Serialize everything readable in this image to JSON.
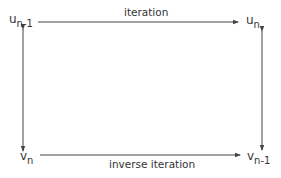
{
  "nodes": {
    "top_left": {
      "base": "u",
      "sub": "n-1"
    },
    "top_right": {
      "base": "u",
      "sub": "n"
    },
    "bottom_left": {
      "base": "v",
      "sub": "n"
    },
    "bottom_right": {
      "base": "v",
      "sub": "n-1"
    }
  },
  "edges": {
    "top": {
      "label": "iteration",
      "from": "u_{n-1}",
      "to": "u_n",
      "direction": "right"
    },
    "bottom": {
      "label": "inverse iteration",
      "from": "v_n",
      "to": "v_{n-1}",
      "direction": "right"
    },
    "left": {
      "label": "",
      "from": "u_{n-1}",
      "to": "v_n",
      "direction": "both"
    },
    "right": {
      "label": "",
      "from": "u_n",
      "to": "v_{n-1}",
      "direction": "both"
    }
  },
  "colors": {
    "line": "#444444",
    "text": "#333333"
  }
}
